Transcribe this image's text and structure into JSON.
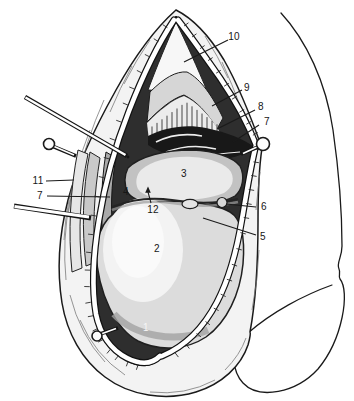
{
  "figure": {
    "callouts": [
      {
        "id": "10",
        "text": "10"
      },
      {
        "id": "9",
        "text": "9"
      },
      {
        "id": "8",
        "text": "8"
      },
      {
        "id": "7-right",
        "text": "7"
      },
      {
        "id": "11",
        "text": "11"
      },
      {
        "id": "7-left",
        "text": "7"
      },
      {
        "id": "4",
        "text": "4"
      },
      {
        "id": "3",
        "text": "3"
      },
      {
        "id": "12",
        "text": "12"
      },
      {
        "id": "6",
        "text": "6"
      },
      {
        "id": "5",
        "text": "5"
      },
      {
        "id": "2",
        "text": "2"
      },
      {
        "id": "1",
        "text": "1"
      }
    ],
    "colors": {
      "ink": "#1a1a1a",
      "paper": "#ffffff",
      "skin": "#f3f3f3",
      "interior_shadow": "#2e2e2e",
      "tissue_light": "#dcdcdc",
      "tissue_mid": "#c2c2c2",
      "highlight": "#f8f8f8"
    },
    "icons": [
      "fixation-pin-icon",
      "retractor-rod-icon",
      "probe-rod-icon",
      "arrow-up-icon"
    ]
  }
}
